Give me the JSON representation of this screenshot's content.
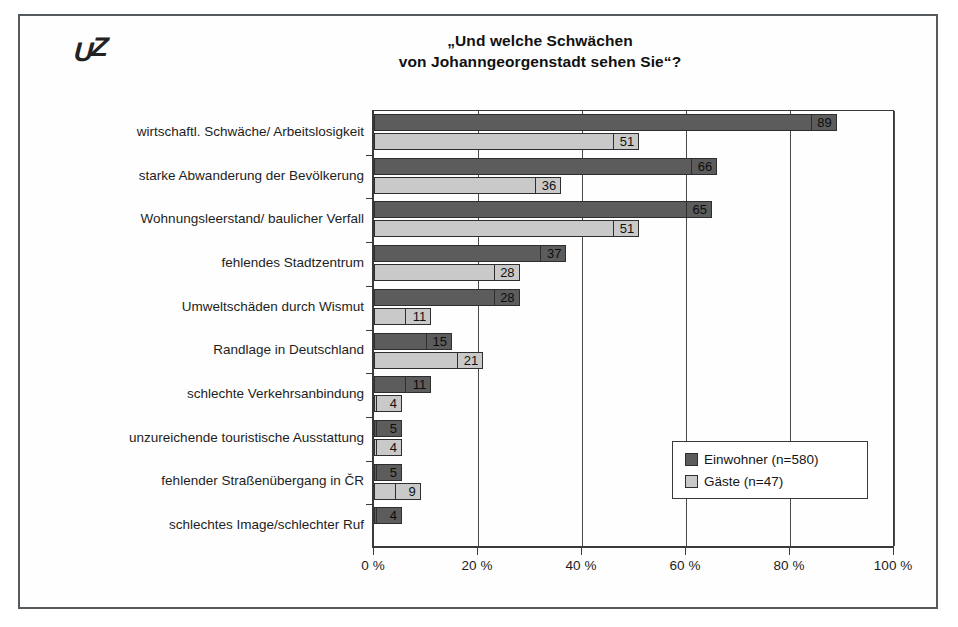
{
  "logo": {
    "text_u": "U",
    "text_z": "Z",
    "name": "uz-logo"
  },
  "chart_data": {
    "type": "bar",
    "orientation": "horizontal",
    "title": "„Und welche Schwächen\nvon Johanngeorgenstadt sehen Sie“?",
    "title_line1": "„Und welche Schwächen",
    "title_line2": "von Johanngeorgenstadt sehen Sie“?",
    "xlabel": "",
    "ylabel": "",
    "xlim": [
      0,
      100
    ],
    "xticks": [
      0,
      20,
      40,
      60,
      80,
      100
    ],
    "xticklabels": [
      "0 %",
      "20 %",
      "40 %",
      "60 %",
      "80 %",
      "100 %"
    ],
    "grid": "vertical",
    "legend_position": "lower-right",
    "categories": [
      "wirtschaftl. Schwäche/ Arbeitslosigkeit",
      "starke Abwanderung der Bevölkerung",
      "Wohnungsleerstand/ baulicher Verfall",
      "fehlendes Stadtzentrum",
      "Umweltschäden durch Wismut",
      "Randlage in Deutschland",
      "schlechte Verkehrsanbindung",
      "unzureichende touristische Ausstattung",
      "fehlender Straßenübergang in ČR",
      "schlechtes Image/schlechter Ruf"
    ],
    "series": [
      {
        "name": "Einwohner (n=580)",
        "color": "#5c5c5c",
        "values": [
          89,
          66,
          65,
          37,
          28,
          15,
          11,
          5,
          5,
          4
        ]
      },
      {
        "name": "Gäste (n=47)",
        "color": "#c9c9c9",
        "values": [
          51,
          36,
          51,
          28,
          11,
          21,
          4,
          4,
          9,
          null
        ]
      }
    ]
  },
  "legend": {
    "items": [
      {
        "label": "Einwohner (n=580)",
        "swatch": "ew"
      },
      {
        "label": "Gäste (n=47)",
        "swatch": "ga"
      }
    ]
  }
}
